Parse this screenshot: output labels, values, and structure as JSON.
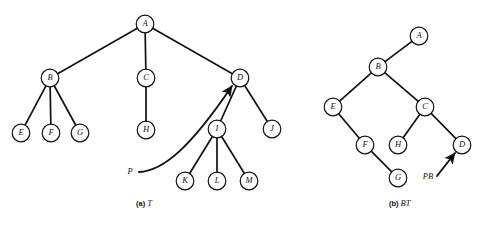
{
  "figure": {
    "width": 481,
    "height": 225,
    "background_color": "#ffffff",
    "ink_color": "#111111"
  },
  "panels": [
    {
      "id": "panel-a",
      "caption_prefix": "(a)",
      "caption_name": "T",
      "caption_x": 136,
      "caption_y": 206,
      "node_radius": 8.8,
      "nodes": [
        {
          "id": "A",
          "label": "A",
          "x": 145,
          "y": 24
        },
        {
          "id": "B",
          "label": "B",
          "x": 50,
          "y": 78
        },
        {
          "id": "C",
          "label": "C",
          "x": 146,
          "y": 78
        },
        {
          "id": "D",
          "label": "D",
          "x": 240,
          "y": 78
        },
        {
          "id": "E",
          "label": "E",
          "x": 21,
          "y": 133
        },
        {
          "id": "F",
          "label": "F",
          "x": 51,
          "y": 133
        },
        {
          "id": "G",
          "label": "G",
          "x": 80,
          "y": 133
        },
        {
          "id": "H",
          "label": "H",
          "x": 146,
          "y": 130
        },
        {
          "id": "I",
          "label": "I",
          "x": 217,
          "y": 129
        },
        {
          "id": "J",
          "label": "J",
          "x": 272,
          "y": 129
        },
        {
          "id": "K",
          "label": "K",
          "x": 185,
          "y": 181
        },
        {
          "id": "L",
          "label": "L",
          "x": 217,
          "y": 181
        },
        {
          "id": "M",
          "label": "M",
          "x": 249,
          "y": 181
        }
      ],
      "edges": [
        {
          "from": "A",
          "to": "B"
        },
        {
          "from": "A",
          "to": "C"
        },
        {
          "from": "A",
          "to": "D"
        },
        {
          "from": "B",
          "to": "E"
        },
        {
          "from": "B",
          "to": "F"
        },
        {
          "from": "B",
          "to": "G"
        },
        {
          "from": "C",
          "to": "H"
        },
        {
          "from": "D",
          "to": "I"
        },
        {
          "from": "D",
          "to": "J"
        },
        {
          "from": "I",
          "to": "K"
        },
        {
          "from": "I",
          "to": "L"
        },
        {
          "from": "I",
          "to": "M"
        }
      ],
      "pointers": [
        {
          "id": "pointer-P",
          "label": "P",
          "label_x": 130,
          "label_y": 172,
          "path": "M 139 172 C 163 171 190 148 232 86",
          "target": "D"
        }
      ]
    },
    {
      "id": "panel-b",
      "caption_prefix": "(b)",
      "caption_name": "BT",
      "caption_x": 389,
      "caption_y": 206,
      "node_radius": 8.8,
      "nodes": [
        {
          "id": "A",
          "label": "A",
          "x": 419,
          "y": 36
        },
        {
          "id": "B",
          "label": "B",
          "x": 378,
          "y": 67
        },
        {
          "id": "E",
          "label": "E",
          "x": 333,
          "y": 107
        },
        {
          "id": "C",
          "label": "C",
          "x": 425,
          "y": 107
        },
        {
          "id": "F",
          "label": "F",
          "x": 365,
          "y": 145
        },
        {
          "id": "H",
          "label": "H",
          "x": 398,
          "y": 145
        },
        {
          "id": "D",
          "label": "D",
          "x": 462,
          "y": 145
        },
        {
          "id": "G",
          "label": "G",
          "x": 398,
          "y": 178
        }
      ],
      "edges": [
        {
          "from": "A",
          "to": "B"
        },
        {
          "from": "B",
          "to": "E"
        },
        {
          "from": "B",
          "to": "C"
        },
        {
          "from": "E",
          "to": "F"
        },
        {
          "from": "C",
          "to": "H"
        },
        {
          "from": "C",
          "to": "D"
        },
        {
          "from": "F",
          "to": "G"
        }
      ],
      "pointers": [
        {
          "id": "pointer-PB",
          "label": "PB",
          "label_x": 428,
          "label_y": 177,
          "path": "M 437 176 L 455 153",
          "target": "D"
        }
      ]
    }
  ]
}
